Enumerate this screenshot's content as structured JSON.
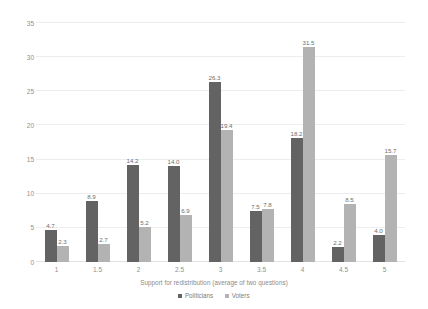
{
  "chart_data": {
    "type": "bar",
    "title": "",
    "xlabel": "Support for redistribution (average of two questions)",
    "ylabel": "Percentage",
    "categories": [
      "1",
      "1.5",
      "2",
      "2.5",
      "3",
      "3.5",
      "4",
      "4.5",
      "5"
    ],
    "series": [
      {
        "name": "Politicians",
        "color": "#636363",
        "values": [
          4.7,
          8.9,
          14.2,
          14.0,
          26.3,
          7.5,
          18.2,
          2.2,
          4.0
        ],
        "labels": [
          "4.7",
          "8.9",
          "14.2",
          "14.0",
          "26.3",
          "7.5",
          "18.2",
          "2.2",
          "4.0"
        ]
      },
      {
        "name": "Voters",
        "color": "#b3b3b3",
        "values": [
          2.3,
          2.7,
          5.2,
          6.9,
          19.4,
          7.8,
          31.5,
          8.5,
          15.7
        ],
        "labels": [
          "2.3",
          "2.7",
          "5.2",
          "6.9",
          "19.4",
          "7.8",
          "31.5",
          "8.5",
          "15.7"
        ]
      }
    ],
    "ylim": [
      0,
      35
    ],
    "yticks": [
      0,
      5,
      10,
      15,
      20,
      25,
      30,
      35
    ],
    "ytick_labels": [
      "0",
      "5",
      "10",
      "15",
      "20",
      "25",
      "30",
      "35"
    ],
    "grid": true,
    "legend_position": "bottom"
  }
}
